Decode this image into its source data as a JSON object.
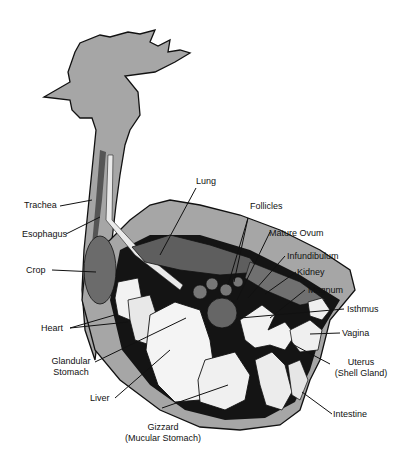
{
  "diagram": {
    "colors": {
      "body_fill": "#a6a6a6",
      "outline": "#111111",
      "cavity": "#141414",
      "organ_light": "#f2f2f2",
      "organ_dark": "#6b6b6b",
      "background": "#ffffff"
    },
    "labels": {
      "trachea": "Trachea",
      "esophagus": "Esophagus",
      "crop": "Crop",
      "heart": "Heart",
      "glandular_stomach_1": "Glandular",
      "glandular_stomach_2": "Stomach",
      "liver": "Liver",
      "gizzard_1": "Gizzard",
      "gizzard_2": "(Mucular Stomach)",
      "lung": "Lung",
      "follicles": "Follicles",
      "mature_ovum": "Mature Ovum",
      "infundibulum": "Infundibulum",
      "kidney": "Kidney",
      "magnum": "Magnum",
      "isthmus": "Isthmus",
      "vagina": "Vagina",
      "uterus_1": "Uterus",
      "uterus_2": "(Shell Gland)",
      "intestine": "Intestine"
    }
  }
}
